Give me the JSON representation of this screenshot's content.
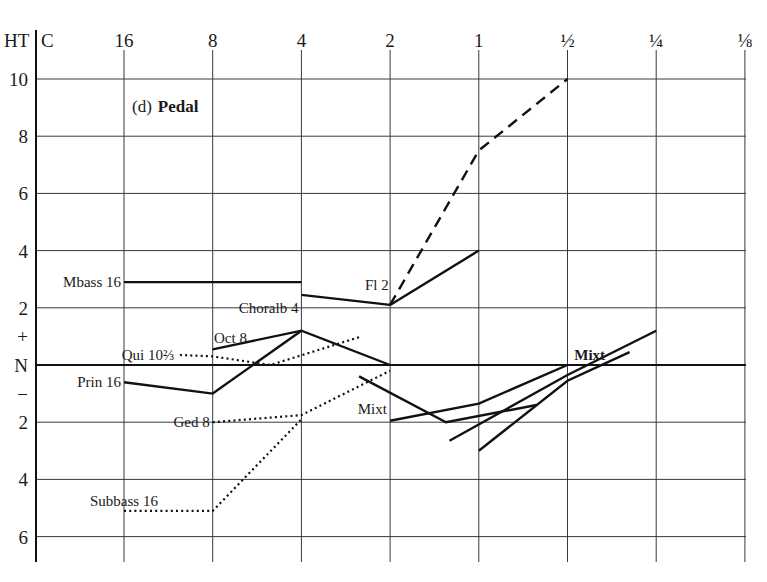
{
  "chart_data": {
    "type": "line",
    "title_prefix": "(d)",
    "title_main": "Pedal",
    "corner_label_left": "HT",
    "corner_label_right": "C",
    "xlabel": "C",
    "ylabel": "HT",
    "x_ticks": [
      "16",
      "8",
      "4",
      "2",
      "1",
      "½",
      "¼",
      "⅛"
    ],
    "y_ticks": [
      {
        "label": "10",
        "value": 10
      },
      {
        "label": "8",
        "value": 8
      },
      {
        "label": "6",
        "value": 6
      },
      {
        "label": "4",
        "value": 4
      },
      {
        "label": "2",
        "value": 2
      },
      {
        "label": "+",
        "value": 1
      },
      {
        "label": "N",
        "value": 0
      },
      {
        "label": "−",
        "value": -1
      },
      {
        "label": "2",
        "value": -2
      },
      {
        "label": "4",
        "value": -4
      },
      {
        "label": "6",
        "value": -6
      }
    ],
    "ylim": [
      -7,
      10.5
    ],
    "grid": true,
    "x_index_note": "x positions are indices into x_ticks (0 = 16 ... 7 = 1/8); fractional values are between ticks",
    "series": [
      {
        "name": "Mbass 16",
        "style": "solid",
        "points": [
          [
            0,
            2.9
          ],
          [
            2,
            2.9
          ]
        ],
        "label_pos": [
          0,
          2.9
        ],
        "label_anchor": "end"
      },
      {
        "name": "Choralb 4",
        "style": "solid",
        "points": [
          [
            2,
            2.45
          ],
          [
            3,
            2.1
          ]
        ],
        "label_pos": [
          2,
          2.0
        ],
        "label_anchor": "end"
      },
      {
        "name": "Fl 2",
        "style": "solid",
        "points": [
          [
            3,
            2.1
          ],
          [
            4,
            4.0
          ]
        ],
        "label_pos": [
          2.85,
          2.8
        ],
        "label_anchor": "middle"
      },
      {
        "name": "Fl 2 (dashed)",
        "style": "dashed",
        "points": [
          [
            3,
            2.1
          ],
          [
            4,
            7.5
          ],
          [
            5,
            10.0
          ]
        ]
      },
      {
        "name": "Oct 8",
        "style": "solid",
        "points": [
          [
            1,
            0.55
          ],
          [
            2,
            1.2
          ],
          [
            3,
            0.0
          ]
        ],
        "label_pos": [
          1.2,
          0.95
        ],
        "label_anchor": "middle"
      },
      {
        "name": "Prin 16",
        "style": "solid",
        "points": [
          [
            0,
            -0.6
          ],
          [
            1,
            -1.0
          ],
          [
            2,
            1.2
          ]
        ],
        "label_pos": [
          0,
          -0.6
        ],
        "label_anchor": "end"
      },
      {
        "name": "Qui 10⅔",
        "style": "dotted",
        "points": [
          [
            0.63,
            0.35
          ],
          [
            1,
            0.3
          ],
          [
            1.65,
            0.0
          ],
          [
            2.68,
            1.0
          ]
        ],
        "label_pos": [
          0.6,
          0.35
        ],
        "label_anchor": "end"
      },
      {
        "name": "Ged 8",
        "style": "dotted",
        "points": [
          [
            1,
            -2.0
          ],
          [
            2,
            -1.75
          ],
          [
            3,
            -0.2
          ]
        ],
        "label_pos": [
          1,
          -2.0
        ],
        "label_anchor": "end"
      },
      {
        "name": "Subbass 16",
        "style": "dotted",
        "points": [
          [
            0,
            -5.1
          ],
          [
            1,
            -5.1
          ],
          [
            2,
            -1.9
          ]
        ],
        "label_pos": [
          0,
          -4.75
        ],
        "label_anchor": "middle"
      },
      {
        "name": "Mixt (a)",
        "style": "solid",
        "points": [
          [
            3,
            -1.95
          ],
          [
            4,
            -1.35
          ],
          [
            5,
            0.0
          ]
        ],
        "label_pos": [
          2.8,
          -1.55
        ],
        "label_anchor": "middle"
      },
      {
        "name": "Mixt (b)",
        "style": "solid",
        "points": [
          [
            2.65,
            -0.4
          ],
          [
            3.63,
            -2.0
          ],
          [
            4.65,
            -1.4
          ]
        ]
      },
      {
        "name": "Mixt (c)",
        "style": "solid",
        "points": [
          [
            3.67,
            -2.65
          ],
          [
            5,
            -0.35
          ],
          [
            6,
            1.2
          ]
        ]
      },
      {
        "name": "Mixt (d)",
        "style": "solid",
        "points": [
          [
            4,
            -3.0
          ],
          [
            5,
            -0.55
          ],
          [
            5.7,
            0.45
          ]
        ],
        "label_pos": [
          5.25,
          0.35
        ],
        "label_anchor": "middle",
        "label_bold": true
      }
    ]
  },
  "labels": {
    "mbass": "Mbass 16",
    "choralb": "Choralb 4",
    "fl2": "Fl 2",
    "oct8": "Oct 8",
    "qui": "Qui 10⅔",
    "prin16": "Prin 16",
    "ged8": "Ged 8",
    "subbass": "Subbass 16",
    "mixt_left": "Mixt",
    "mixt_right": "Mixt"
  }
}
